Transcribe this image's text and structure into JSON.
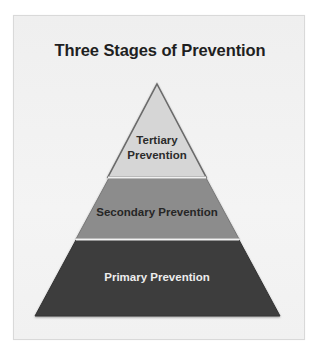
{
  "diagram": {
    "title": "Three Stages of Prevention",
    "type": "pyramid",
    "layers": [
      {
        "position": "top",
        "label_line1": "Tertiary",
        "label_line2": "Prevention",
        "color": "#d6d6d6",
        "text_color": "#2b2b2b"
      },
      {
        "position": "middle",
        "label": "Secondary Prevention",
        "color": "#8c8c8c",
        "text_color": "#262626"
      },
      {
        "position": "bottom",
        "label": "Primary Prevention",
        "color": "#3c3c3c",
        "text_color": "#ededed"
      }
    ],
    "outline_color": "#6a6a6a",
    "separator_color": "#f2f2f2"
  }
}
